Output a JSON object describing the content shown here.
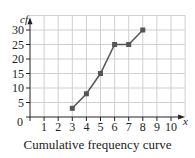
{
  "chart_data": {
    "type": "line",
    "title": "Cumulative frequency curve",
    "xlabel": "x",
    "ylabel": "cf",
    "x": [
      3,
      4,
      5,
      6,
      7,
      8
    ],
    "values": [
      3,
      8,
      15,
      25,
      25,
      30
    ],
    "xlim": [
      0,
      10
    ],
    "ylim": [
      0,
      30
    ],
    "xticks": [
      "1",
      "2",
      "3",
      "4",
      "5",
      "6",
      "7",
      "8",
      "9",
      "10"
    ],
    "yticks": [
      "5",
      "10",
      "15",
      "20",
      "25",
      "30"
    ],
    "origin_label": "0",
    "grid": true,
    "marker": "square",
    "line_color": "#555555",
    "grid_color": "#cfcfcf"
  },
  "caption": "Cumulative frequency curve"
}
